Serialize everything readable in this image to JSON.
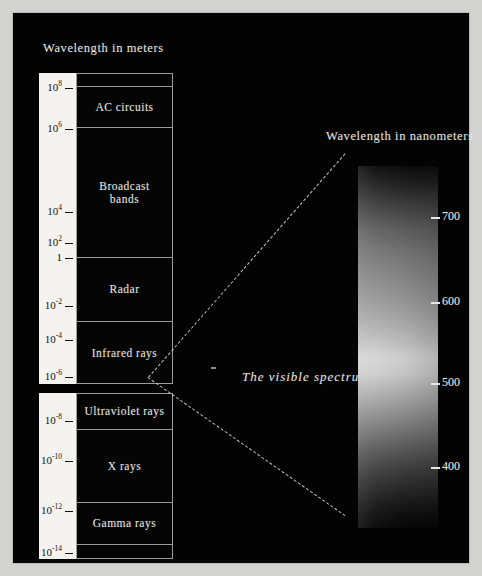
{
  "titles": {
    "meters": "Wavelength in meters",
    "nanometers": "Wavelength in nanometers",
    "visible": "The visible spectrum"
  },
  "colors": {
    "panel_background": "#030303",
    "mat": "#d2d2d0",
    "scale_strip": "#f4f3ef",
    "text": "#e8e6e0",
    "tick_text": "#14120f",
    "rule": "#9d9d99",
    "ray": "#cfcdc6"
  },
  "chart_data": {
    "type": "bar",
    "title": "Wavelength in meters",
    "ylabel": "Wavelength in meters",
    "xlabel": "",
    "grid": false,
    "legend": null,
    "axis_scale": "log10",
    "ylim": [
      1e-14,
      1000000000.0
    ],
    "meters_axis": {
      "label": "Wavelength in meters",
      "ticks": [
        {
          "mantissa": "10",
          "exponent": "8",
          "value": 100000000.0,
          "top": 66
        },
        {
          "mantissa": "10",
          "exponent": "6",
          "value": 1000000.0,
          "top": 107
        },
        {
          "mantissa": "10",
          "exponent": "4",
          "value": 10000.0,
          "top": 190
        },
        {
          "mantissa": "10",
          "exponent": "2",
          "value": 100.0,
          "top": 221
        },
        {
          "mantissa": "1",
          "exponent": "",
          "value": 1,
          "top": 238
        },
        {
          "mantissa": "10",
          "exponent": "-2",
          "value": 0.01,
          "top": 284
        },
        {
          "mantissa": "10",
          "exponent": "-4",
          "value": 0.0001,
          "top": 318
        },
        {
          "mantissa": "10",
          "exponent": "-6",
          "value": 1e-06,
          "top": 355
        },
        {
          "mantissa": "10",
          "exponent": "-8",
          "value": 1e-08,
          "top": 399
        },
        {
          "mantissa": "10",
          "exponent": "-10",
          "value": 1e-10,
          "top": 439
        },
        {
          "mantissa": "10",
          "exponent": "-12",
          "value": 1e-12,
          "top": 489
        },
        {
          "mantissa": "10",
          "exponent": "-14",
          "value": 1e-14,
          "top": 531
        }
      ]
    },
    "nanometers_axis": {
      "label": "Wavelength in nanometers",
      "ticks": [
        {
          "label": "700",
          "value": 700,
          "top": 196
        },
        {
          "label": "600",
          "value": 600,
          "top": 281
        },
        {
          "label": "500",
          "value": 500,
          "top": 362
        },
        {
          "label": "400",
          "value": 400,
          "top": 446
        }
      ]
    },
    "bands_upper": [
      {
        "label": "",
        "top": 0,
        "height": 13
      },
      {
        "label": "AC circuits",
        "top": 13,
        "height": 41
      },
      {
        "label": "Broadcast\nbands",
        "top": 54,
        "height": 130
      },
      {
        "label": "Radar",
        "top": 184,
        "height": 64
      },
      {
        "label": "Infrared rays",
        "top": 248,
        "height": 63
      }
    ],
    "bands_lower": [
      {
        "label": "Ultraviolet rays",
        "top": 0,
        "height": 36
      },
      {
        "label": "X rays",
        "top": 36,
        "height": 73
      },
      {
        "label": "Gamma rays",
        "top": 109,
        "height": 42
      },
      {
        "label": "",
        "top": 151,
        "height": 15
      }
    ],
    "spectrum": {
      "caption": "The visible spectrum",
      "type": "continuous-gradient",
      "rendering": "grayscale",
      "range_nm": [
        380,
        760
      ]
    }
  }
}
